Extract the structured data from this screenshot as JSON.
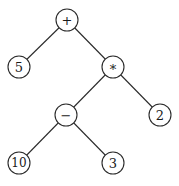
{
  "diagram": {
    "type": "expression-tree",
    "nodes": [
      {
        "id": "plus",
        "label": "+",
        "x": 67,
        "y": 20
      },
      {
        "id": "five",
        "label": "5",
        "x": 19,
        "y": 67
      },
      {
        "id": "times",
        "label": "*",
        "x": 113,
        "y": 67
      },
      {
        "id": "minus",
        "label": "−",
        "x": 66,
        "y": 115
      },
      {
        "id": "two",
        "label": "2",
        "x": 160,
        "y": 115
      },
      {
        "id": "ten",
        "label": "10",
        "x": 19,
        "y": 163
      },
      {
        "id": "three",
        "label": "3",
        "x": 113,
        "y": 163
      }
    ],
    "edges": [
      [
        "plus",
        "five"
      ],
      [
        "plus",
        "times"
      ],
      [
        "times",
        "minus"
      ],
      [
        "times",
        "two"
      ],
      [
        "minus",
        "ten"
      ],
      [
        "minus",
        "three"
      ]
    ],
    "node_radius": 11
  }
}
